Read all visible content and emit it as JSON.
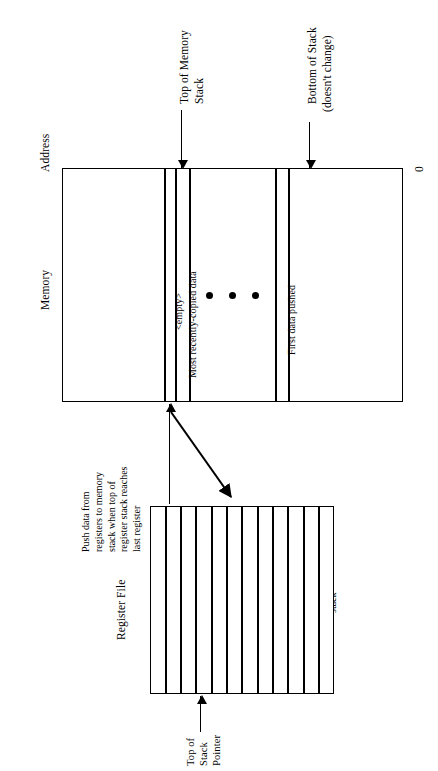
{
  "diagram": {
    "orientation": "rotated-90-ccw",
    "ink_color": "#000000",
    "background_color": "#ffffff"
  },
  "axis_labels": {
    "address": "Address",
    "memory": "Memory",
    "register_file": "Register File",
    "zero": "0"
  },
  "memory": {
    "cells": [
      {
        "label": "<empty>"
      },
      {
        "label": "Most recently-copied data"
      },
      {
        "label": "First data pushed"
      }
    ],
    "ellipsis_dots": 3
  },
  "pointers": {
    "top_of_memory_stack": {
      "line1": "Top of Memory",
      "line2": "Stack"
    },
    "bottom_of_stack": {
      "line1": "Bottom of Stack",
      "line2": "(doesn't change)"
    },
    "top_of_stack_pointer": {
      "line1": "Top of",
      "line2": "Stack",
      "line3": "Pointer"
    }
  },
  "annotations": {
    "push": {
      "lines": [
        "Push data from",
        "registers to memory",
        "stack when top of",
        "register stack reaches",
        "last register"
      ]
    },
    "pop": {
      "lines": [
        "Pop data",
        "off of memory",
        "stack and into",
        "registers when",
        "top of register",
        "stack reaches",
        "bottom of register",
        "stack"
      ]
    }
  },
  "register_file": {
    "cell_count": 12
  }
}
